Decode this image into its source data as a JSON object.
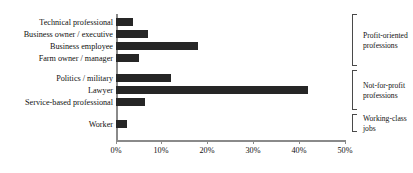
{
  "chart_data": {
    "type": "bar",
    "orientation": "horizontal",
    "title": "",
    "xlabel": "",
    "ylabel": "",
    "xlim": [
      0,
      50
    ],
    "xticks": [
      0,
      10,
      20,
      30,
      40,
      50
    ],
    "xtick_labels": [
      "0%",
      "10%",
      "20%",
      "30%",
      "40%",
      "50%"
    ],
    "grid": false,
    "legend": null,
    "categories": [
      "Technical professional",
      "Business owner / executive",
      "Business employee",
      "Farm owner / manager",
      "Politics / military",
      "Lawyer",
      "Service-based professional",
      "Worker"
    ],
    "values": [
      3.7,
      7.0,
      18.0,
      5.0,
      12.0,
      42.0,
      6.4,
      2.5
    ],
    "bar_color": "#262626",
    "axis_color": "#8a8a8a",
    "groups": [
      {
        "label_lines": [
          "Profit-oriented",
          "professions"
        ],
        "members": [
          0,
          1,
          2,
          3
        ]
      },
      {
        "label_lines": [
          "Not-for-profit",
          "professions"
        ],
        "members": [
          4,
          5,
          6
        ]
      },
      {
        "label_lines": [
          "Working-class",
          "jobs"
        ],
        "members": [
          7
        ]
      }
    ]
  }
}
